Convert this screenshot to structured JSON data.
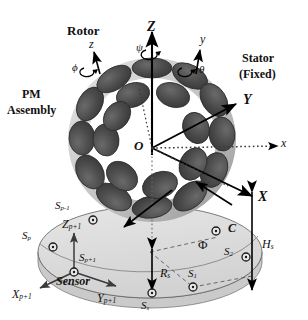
{
  "figure": {
    "annotations": {
      "rotor": "Rotor",
      "stator": "Stator",
      "stator_fixed": "(Fixed)",
      "pm": "PM",
      "assembly": "Assembly",
      "sensor": "Sensor",
      "origin": "O",
      "center_point": "C"
    },
    "axes": {
      "fixed": [
        {
          "name": "Z-axis",
          "label": "Z"
        },
        {
          "name": "Y-axis",
          "label": "Y"
        },
        {
          "name": "X-axis",
          "label": "X"
        }
      ],
      "rotor": [
        {
          "name": "z-axis",
          "label": "z"
        },
        {
          "name": "y-axis",
          "label": "y"
        },
        {
          "name": "x-axis",
          "label": "x"
        }
      ],
      "local": [
        {
          "name": "Zp1-axis",
          "label": "Z",
          "sub": "p+1"
        },
        {
          "name": "Xp1-axis",
          "label": "X",
          "sub": "p+1"
        },
        {
          "name": "Yp1-axis",
          "label": "Y",
          "sub": "p+1"
        }
      ]
    },
    "angles": [
      {
        "name": "psi",
        "label": "ψ"
      },
      {
        "name": "theta",
        "label": "θ"
      },
      {
        "name": "phi-rotor",
        "label": "ϕ"
      },
      {
        "name": "phi-sensor",
        "label": "Φ"
      }
    ],
    "dimensions": [
      {
        "name": "sensor-radius",
        "label": "R",
        "sub": "s"
      },
      {
        "name": "sensor-height",
        "label": "H",
        "sub": "s"
      }
    ],
    "sensors": [
      {
        "name": "sensor-s-sub-s",
        "label": "S",
        "sub": "s"
      },
      {
        "name": "sensor-s1",
        "label": "S",
        "sub": "1"
      },
      {
        "name": "sensor-s2",
        "label": "S",
        "sub": "2"
      },
      {
        "name": "sensor-sp-minus-1",
        "label": "S",
        "sub": "p-1"
      },
      {
        "name": "sensor-sp",
        "label": "S",
        "sub": "p"
      },
      {
        "name": "sensor-sp-plus-1",
        "label": "S",
        "sub": "p+1"
      }
    ]
  },
  "colors": {
    "magnet_dark": "#4a4a4a",
    "magnet_edge": "#2b2b2b",
    "ring_light": "#c9c9c9",
    "ring_shadow": "#9a9a9a",
    "sensor_plane": "#dcdcdc",
    "line": "#000000",
    "dotted": "#555555"
  }
}
